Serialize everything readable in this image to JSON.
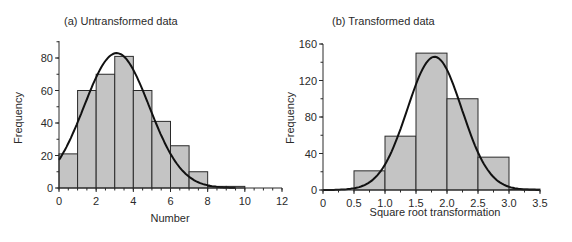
{
  "chart_data": [
    {
      "type": "bar",
      "title": "(a) Untransformed data",
      "xlabel": "Number",
      "ylabel": "Frequency",
      "xlim": [
        0,
        12
      ],
      "ylim": [
        0,
        90
      ],
      "x_ticks": [
        "0",
        "2",
        "4",
        "6",
        "8",
        "10",
        "12"
      ],
      "y_ticks": [
        "0",
        "20",
        "40",
        "60",
        "80"
      ],
      "bin_edges": [
        0,
        1,
        2,
        3,
        4,
        5,
        6,
        7,
        8,
        9,
        10
      ],
      "values": [
        21,
        60,
        70,
        81,
        60,
        41,
        26,
        10,
        1,
        1
      ],
      "overlay": {
        "type": "normal_curve",
        "peak_x": 3.1,
        "peak_y": 83
      },
      "grid": false
    },
    {
      "type": "bar",
      "title": "(b) Transformed data",
      "xlabel": "Square root transformation",
      "ylabel": "Frequency",
      "xlim": [
        0,
        3.5
      ],
      "ylim": [
        0,
        160
      ],
      "x_ticks": [
        "0",
        "0.5",
        "1.0",
        "1.5",
        "2.0",
        "2.5",
        "3.0",
        "3.5"
      ],
      "y_ticks": [
        "0",
        "40",
        "80",
        "120",
        "160"
      ],
      "bin_edges": [
        0.5,
        1.0,
        1.5,
        2.0,
        2.5,
        3.0,
        3.5
      ],
      "values": [
        21,
        59,
        150,
        100,
        36,
        1
      ],
      "overlay": {
        "type": "normal_curve",
        "peak_x": 1.8,
        "peak_y": 146
      },
      "grid": false
    }
  ]
}
